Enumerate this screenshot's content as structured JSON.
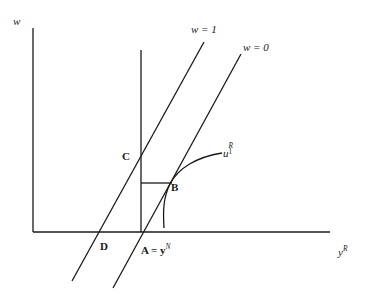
{
  "figure": {
    "type": "economics-diagram",
    "background_color": "#ffffff",
    "line_color": "#1a1a1a",
    "axes": {
      "y_axis_label": "w",
      "x_axis_label_base": "y",
      "x_axis_label_superscript": "R",
      "x_axis_label_full": "y^R",
      "origin_px": [
        33,
        232
      ],
      "y_axis_top_px": [
        33,
        28
      ],
      "x_axis_right_px": [
        330,
        232
      ]
    },
    "curves": [
      {
        "name": "wage-line-w1",
        "label": "w = 1",
        "kind": "straight-line",
        "from_px": [
          72,
          281
        ],
        "to_px": [
          204,
          42
        ]
      },
      {
        "name": "wage-line-w0",
        "label": "w = 0",
        "kind": "straight-line",
        "from_px": [
          113,
          288
        ],
        "to_px": [
          241,
          54
        ]
      },
      {
        "name": "endowment-line",
        "label": "",
        "kind": "vertical-line",
        "from_px": [
          141,
          50
        ],
        "to_px": [
          141,
          232
        ]
      },
      {
        "name": "indifference-curve",
        "label_base": "u",
        "label_subscript": "1",
        "label_superscript": "R",
        "label_full": "u_1^R",
        "kind": "concave-curve"
      },
      {
        "name": "horizontal-connector",
        "label": "",
        "kind": "horizontal-segment",
        "from_px": [
          141,
          183
        ],
        "to_px": [
          172,
          183
        ]
      }
    ],
    "points": [
      {
        "name": "point-C",
        "label": "C",
        "px": [
          141,
          158
        ]
      },
      {
        "name": "point-B",
        "label": "B",
        "px": [
          170,
          183
        ]
      },
      {
        "name": "point-D",
        "label": "D",
        "px": [
          111,
          232
        ]
      },
      {
        "name": "point-A",
        "label": "A = y^N",
        "label_base": "A = y",
        "label_superscript": "N",
        "px": [
          141,
          232
        ]
      }
    ]
  }
}
